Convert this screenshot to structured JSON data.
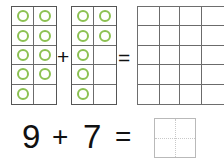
{
  "worksheet": {
    "title": "Ten-frame addition worksheet",
    "accent_color": "#8cc152",
    "frame_border_color": "#6b6b6b",
    "answer_box_border_color": "#b9b9b9"
  },
  "frames_row": {
    "plus_symbol": "+",
    "equals_symbol": "=",
    "frames": [
      {
        "id": "frame-a",
        "label": "first-addend-ten-frame",
        "filled_count": 9,
        "capacity": 10,
        "cells": [
          [
            1,
            1
          ],
          [
            1,
            1
          ],
          [
            1,
            1
          ],
          [
            1,
            1
          ],
          [
            1,
            0
          ]
        ]
      },
      {
        "id": "frame-b",
        "label": "second-addend-ten-frame",
        "filled_count": 7,
        "capacity": 10,
        "cells": [
          [
            1,
            1
          ],
          [
            1,
            1
          ],
          [
            1,
            0
          ],
          [
            1,
            0
          ],
          [
            1,
            0
          ]
        ]
      },
      {
        "id": "frame-c",
        "label": "sum-ten-frame-one",
        "filled_count": 0,
        "capacity": 10,
        "cells": [
          [
            0,
            0
          ],
          [
            0,
            0
          ],
          [
            0,
            0
          ],
          [
            0,
            0
          ],
          [
            0,
            0
          ]
        ]
      },
      {
        "id": "frame-d",
        "label": "sum-ten-frame-two",
        "filled_count": 0,
        "capacity": 10,
        "cells": [
          [
            0,
            0
          ],
          [
            0,
            0
          ],
          [
            0,
            0
          ],
          [
            0,
            0
          ],
          [
            0,
            0
          ]
        ]
      }
    ]
  },
  "sentence_row": {
    "first_addend": "9",
    "plus_symbol": "+",
    "second_addend": "7",
    "equals_symbol": "=",
    "answer_value": ""
  }
}
